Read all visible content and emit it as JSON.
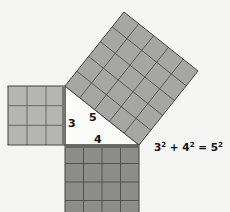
{
  "diagram": {
    "type": "pythagorean-theorem",
    "labels": {
      "side_a": "3",
      "side_b": "4",
      "side_c": "5"
    },
    "equation": {
      "a": "3",
      "plus": "+",
      "b": "4",
      "equals": "=",
      "c": "5",
      "exp": "2"
    },
    "squares": [
      {
        "name": "small-square",
        "grid": 3,
        "color": "#b3b3b1"
      },
      {
        "name": "bottom-square",
        "grid": 4,
        "color": "#8a8a88"
      },
      {
        "name": "hypotenuse-square",
        "grid": 5,
        "color": "#a3a3a1"
      }
    ]
  }
}
